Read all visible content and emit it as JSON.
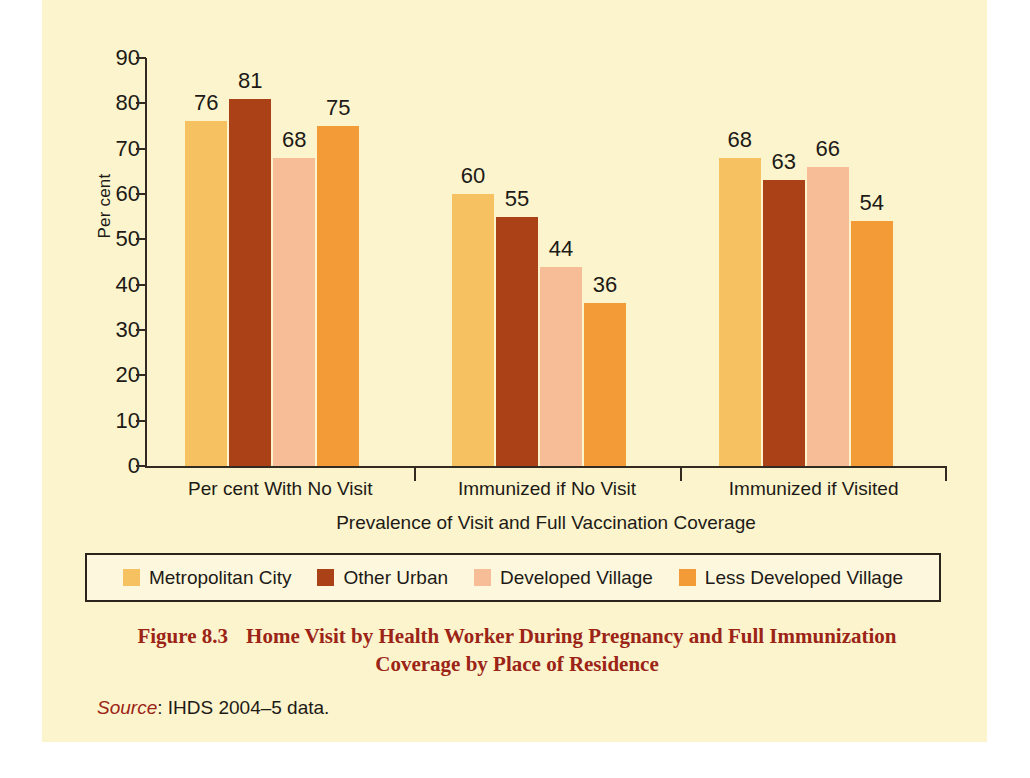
{
  "figure": {
    "background_color": "#fbf4cc",
    "caption_number": "Figure 8.3",
    "caption_line1": "Home Visit by Health Worker During Pregnancy and Full Immunization",
    "caption_line2": "Coverage by Place of Residence",
    "caption_color": "#9c2417",
    "source_label": "Source",
    "source_separator": ": ",
    "source_text": "IHDS 2004–5 data."
  },
  "chart_data": {
    "type": "bar",
    "title": "",
    "subtitle": "",
    "xlabel": "Prevalence of Visit and Full Vaccination Coverage",
    "ylabel": "Per cent",
    "ylim": [
      0,
      90
    ],
    "ytick_step": 10,
    "yticks": [
      90,
      80,
      70,
      60,
      50,
      40,
      30,
      20,
      10,
      0
    ],
    "ytick_labels": [
      "90",
      "80",
      "70",
      "60",
      "50",
      "40",
      "30",
      "20",
      "10",
      "0"
    ],
    "grid": false,
    "legend_position": "bottom",
    "categories": [
      "Per cent With No Visit",
      "Immunized if No Visit",
      "Immunized if Visited"
    ],
    "series": [
      {
        "name": "Metropolitan City",
        "color": "#f6c261",
        "values": [
          76,
          81,
          68
        ],
        "values_by_category": [
          76,
          60,
          68
        ]
      },
      {
        "name": "Other Urban",
        "color": "#ab4117",
        "values": [
          81,
          55,
          63
        ],
        "values_by_category": [
          81,
          55,
          63
        ]
      },
      {
        "name": "Developed Village",
        "color": "#f7bd96",
        "values": [
          68,
          44,
          66
        ],
        "values_by_category": [
          68,
          44,
          66
        ]
      },
      {
        "name": "Less Developed Village",
        "color": "#f39c37",
        "values": [
          75,
          36,
          54
        ],
        "values_by_category": [
          75,
          36,
          54
        ]
      }
    ],
    "groups": [
      {
        "category": "Per cent With No Visit",
        "bars": [
          {
            "series": "Metropolitan City",
            "value": 76,
            "label": "76",
            "color": "#f6c261"
          },
          {
            "series": "Other Urban",
            "value": 81,
            "label": "81",
            "color": "#ab4117"
          },
          {
            "series": "Developed Village",
            "value": 68,
            "label": "68",
            "color": "#f7bd96"
          },
          {
            "series": "Less Developed Village",
            "value": 75,
            "label": "75",
            "color": "#f39c37"
          }
        ]
      },
      {
        "category": "Immunized if No Visit",
        "bars": [
          {
            "series": "Metropolitan City",
            "value": 60,
            "label": "60",
            "color": "#f6c261"
          },
          {
            "series": "Other Urban",
            "value": 55,
            "label": "55",
            "color": "#ab4117"
          },
          {
            "series": "Developed Village",
            "value": 44,
            "label": "44",
            "color": "#f7bd96"
          },
          {
            "series": "Less Developed Village",
            "value": 36,
            "label": "36",
            "color": "#f39c37"
          }
        ]
      },
      {
        "category": "Immunized if Visited",
        "bars": [
          {
            "series": "Metropolitan City",
            "value": 68,
            "label": "68",
            "color": "#f6c261"
          },
          {
            "series": "Other Urban",
            "value": 63,
            "label": "63",
            "color": "#ab4117"
          },
          {
            "series": "Developed Village",
            "value": 66,
            "label": "66",
            "color": "#f7bd96"
          },
          {
            "series": "Less Developed Village",
            "value": 54,
            "label": "54",
            "color": "#f39c37"
          }
        ]
      }
    ]
  },
  "legend": {
    "entries": [
      {
        "label": "Metropolitan City",
        "color": "#f6c261"
      },
      {
        "label": "Other Urban",
        "color": "#ab4117"
      },
      {
        "label": "Developed Village",
        "color": "#f7bd96"
      },
      {
        "label": "Less Developed Village",
        "color": "#f39c37"
      }
    ]
  }
}
